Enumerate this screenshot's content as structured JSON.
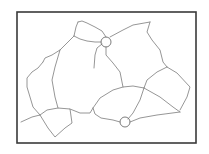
{
  "diagram": {
    "type": "network-line-drawing",
    "frame": {
      "x": 17,
      "y": 12,
      "width": 179,
      "height": 131,
      "stroke": "#3a3a3a"
    },
    "line_color": "#8a8a8a",
    "paths": [
      "M78,22 L82,21 L87,23 L95,27 L102,31 L106,37",
      "M78,22 L76,27 L74,36",
      "M74,36 L80,39 L87,41 L95,42 L101,42",
      "M74,36 L68,42 L60,50",
      "M60,50 L52,55 L45,58 L43,62",
      "M43,62 L38,68 L32,72 L27,78 L27,87 L30,97 L33,107 L40,115",
      "M40,115 L32,117 L21,122",
      "M60,50 L55,67 L52,80 L55,97 L58,108",
      "M40,115 L47,110 L58,108 L70,109 L72,123 L65,128 L55,137 L48,128 L40,115",
      "M70,109 L80,113 L90,113 L93,108",
      "M110,37 L123,30 L133,25 L150,22",
      "M150,22 L147,32 L152,40 L160,50 L163,62 L167,67",
      "M167,67 L157,72 L147,80 L144,88",
      "M167,67 L177,73 L190,87 L187,97 L180,110",
      "M106,47 L106,55 L113,63 L120,72 L123,87",
      "M102,44 L97,48 L95,55 L94,68",
      "M93,108 L100,98 L113,90 L123,87 L133,86 L144,88",
      "M93,108 L95,114 L101,118 L113,120 L120,122",
      "M144,88 L160,97 L173,107 L180,112",
      "M144,88 L140,100 L133,113 L128,119",
      "M130,122 L140,118 L157,115 L180,112"
    ],
    "markers": [
      {
        "label": "circle-marker-1",
        "cx": 106,
        "cy": 42,
        "r": 5
      },
      {
        "label": "circle-marker-2",
        "cx": 125,
        "cy": 122,
        "r": 5
      }
    ]
  }
}
